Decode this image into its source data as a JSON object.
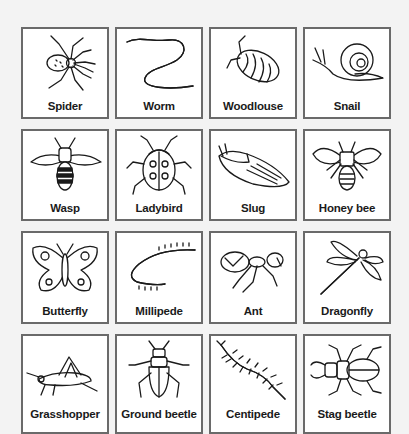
{
  "cards": [
    {
      "label": "Spider",
      "icon": "spider-icon"
    },
    {
      "label": "Worm",
      "icon": "worm-icon"
    },
    {
      "label": "Woodlouse",
      "icon": "woodlouse-icon"
    },
    {
      "label": "Snail",
      "icon": "snail-icon"
    },
    {
      "label": "Wasp",
      "icon": "wasp-icon"
    },
    {
      "label": "Ladybird",
      "icon": "ladybird-icon"
    },
    {
      "label": "Slug",
      "icon": "slug-icon"
    },
    {
      "label": "Honey bee",
      "icon": "honey-bee-icon"
    },
    {
      "label": "Butterfly",
      "icon": "butterfly-icon"
    },
    {
      "label": "Millipede",
      "icon": "millipede-icon"
    },
    {
      "label": "Ant",
      "icon": "ant-icon"
    },
    {
      "label": "Dragonfly",
      "icon": "dragonfly-icon"
    },
    {
      "label": "Grasshopper",
      "icon": "grasshopper-icon"
    },
    {
      "label": "Ground beetle",
      "icon": "ground-beetle-icon"
    },
    {
      "label": "Centipede",
      "icon": "centipede-icon"
    },
    {
      "label": "Stag beetle",
      "icon": "stag-beetle-icon"
    }
  ],
  "colors": {
    "background": "#f3f3f3",
    "card_fill": "#ffffff",
    "card_border": "#6a6a6a",
    "ink": "#1a1a1a"
  }
}
